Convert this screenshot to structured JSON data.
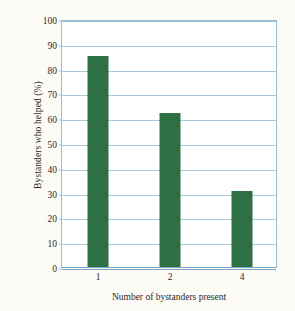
{
  "chart_data": {
    "type": "bar",
    "title": "",
    "xlabel": "Number of bystanders present",
    "ylabel": "Bystanders who helped (%)",
    "categories": [
      "1",
      "2",
      "4"
    ],
    "values": [
      85,
      62,
      30.5
    ],
    "ylim": [
      0,
      100
    ],
    "y_tick_labels": [
      "0",
      "10",
      "20",
      "30",
      "40",
      "50",
      "60",
      "70",
      "80",
      "90",
      "100"
    ],
    "y_tick_values": [
      0,
      10,
      20,
      30,
      40,
      50,
      60,
      70,
      80,
      90,
      100
    ],
    "grid": true,
    "legend": "none",
    "series": [
      {
        "name": "Bystanders who helped (%)",
        "values": [
          85,
          62,
          30.5
        ]
      }
    ],
    "colors": {
      "bar_fill": "#2e7044",
      "gridline": "#a9c7dd",
      "axis_line": "#7ba7c4",
      "frame": "#9bbdd6",
      "plot_background": "#ffffff",
      "figure_background": "#fdfbf6",
      "text": "#2a2a2a"
    }
  }
}
